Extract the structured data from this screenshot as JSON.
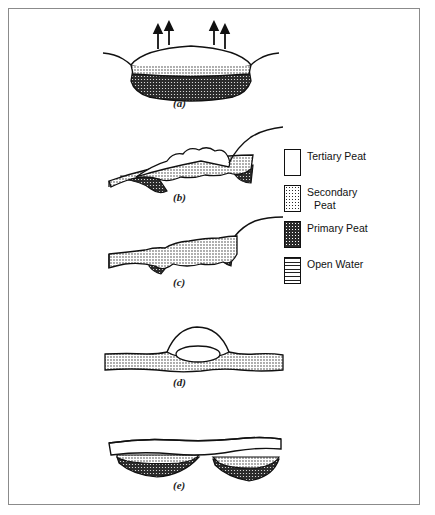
{
  "figure": {
    "type": "scientific-diagram",
    "background_color": "#ffffff",
    "border_color": "#8b8b8b"
  },
  "panels": [
    {
      "id": "a",
      "label": "(a)",
      "label_x": 172,
      "label_y": 90,
      "layers": [
        "Tertiary Peat",
        "Secondary Peat",
        "Primary Peat"
      ],
      "arrows": 4,
      "arrow_direction": "up"
    },
    {
      "id": "b",
      "label": "(b)",
      "label_x": 172,
      "label_y": 187,
      "layers": [
        "Tertiary Peat",
        "Secondary Peat",
        "Primary Peat"
      ],
      "arrows": 0
    },
    {
      "id": "c",
      "label": "(c)",
      "label_x": 172,
      "label_y": 275,
      "layers": [
        "Secondary Peat",
        "Primary Peat"
      ],
      "arrows": 0
    },
    {
      "id": "d",
      "label": "(d)",
      "label_x": 172,
      "label_y": 373,
      "layers": [
        "Tertiary Peat",
        "Secondary Peat",
        "Open Water"
      ],
      "arrows": 0
    },
    {
      "id": "e",
      "label": "(e)",
      "label_x": 172,
      "label_y": 474,
      "layers": [
        "Tertiary Peat",
        "Secondary Peat",
        "Primary Peat"
      ],
      "arrows": 0
    }
  ],
  "legend": {
    "items": [
      {
        "label": "Tertiary Peat",
        "pattern": "white",
        "line2": ""
      },
      {
        "label": "Secondary",
        "pattern": "stipple-light",
        "line2": "Peat"
      },
      {
        "label": "Primary Peat",
        "pattern": "stipple-dark",
        "line2": ""
      },
      {
        "label": "Open Water",
        "pattern": "horizontal-lines",
        "line2": ""
      }
    ]
  },
  "colors": {
    "ink": "#111111",
    "primary_peat_fill": "#2b2b2b",
    "secondary_peat_fill": "#ffffff",
    "paper": "#ffffff"
  }
}
